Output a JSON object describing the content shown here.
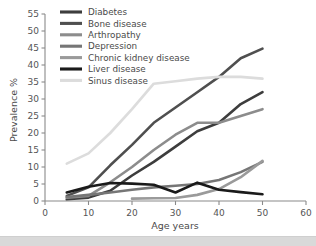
{
  "chart_data": {
    "type": "line",
    "title": "",
    "xlabel": "Age years",
    "ylabel": "Prevalence %",
    "xlim": [
      0,
      60
    ],
    "ylim": [
      0,
      55
    ],
    "xticks": [
      0,
      10,
      20,
      30,
      40,
      50,
      60
    ],
    "yticks": [
      0,
      5,
      10,
      15,
      20,
      25,
      30,
      35,
      40,
      45,
      50,
      55
    ],
    "grid": false,
    "legend_position": "top-left",
    "series": [
      {
        "name": "Diabetes",
        "color": "#3d3d3d",
        "width": 2.6,
        "x": [
          5,
          10,
          15,
          20,
          25,
          30,
          35,
          40,
          45,
          50
        ],
        "y": [
          0.5,
          1.0,
          3.0,
          7.5,
          11.5,
          16.0,
          20.5,
          23.0,
          28.5,
          32.0
        ]
      },
      {
        "name": "Bone disease",
        "color": "#4f4f4f",
        "width": 2.6,
        "x": [
          5,
          10,
          15,
          20,
          25,
          30,
          35,
          40,
          45,
          50
        ],
        "y": [
          1.5,
          4.0,
          10.5,
          16.5,
          23.0,
          27.5,
          32.0,
          36.5,
          42.0,
          44.8
        ]
      },
      {
        "name": "Arthropathy",
        "color": "#8c8c8c",
        "width": 2.6,
        "x": [
          5,
          10,
          15,
          20,
          25,
          30,
          35,
          40,
          45,
          50
        ],
        "y": [
          1.0,
          1.5,
          5.5,
          10.0,
          15.0,
          19.5,
          23.0,
          23.0,
          25.0,
          27.0
        ]
      },
      {
        "name": "Depression",
        "color": "#767676",
        "width": 2.6,
        "x": [
          5,
          10,
          15,
          20,
          25,
          30,
          35,
          40,
          45,
          50
        ],
        "y": [
          1.2,
          1.8,
          2.5,
          3.3,
          4.0,
          4.5,
          5.0,
          6.2,
          8.5,
          11.5
        ]
      },
      {
        "name": "Chronic kidney disease",
        "color": "#9a9a9a",
        "width": 2.6,
        "x": [
          20,
          25,
          30,
          35,
          40,
          45,
          50
        ],
        "y": [
          0.7,
          0.8,
          0.9,
          1.8,
          3.5,
          7.0,
          11.8
        ]
      },
      {
        "name": "Liver disease",
        "color": "#1a1a1a",
        "width": 2.6,
        "x": [
          5,
          10,
          15,
          20,
          25,
          30,
          35,
          40,
          45,
          50
        ],
        "y": [
          2.5,
          4.2,
          5.3,
          5.1,
          4.8,
          2.5,
          5.4,
          3.3,
          2.6,
          2.0
        ]
      },
      {
        "name": "Sinus disease",
        "color": "#dcdcdc",
        "width": 2.6,
        "x": [
          5,
          10,
          15,
          20,
          25,
          30,
          35,
          40,
          45,
          50
        ],
        "y": [
          11.0,
          14.0,
          20.0,
          27.0,
          34.5,
          35.2,
          36.0,
          36.5,
          36.5,
          36.0
        ]
      }
    ]
  },
  "axes": {
    "y_title": "Prevalence %",
    "x_title": "Age years",
    "y_tick_labels": [
      "0",
      "5",
      "10",
      "15",
      "20",
      "25",
      "30",
      "35",
      "40",
      "45",
      "50",
      "55"
    ],
    "x_tick_labels": [
      "0",
      "10",
      "20",
      "30",
      "40",
      "50",
      "60"
    ],
    "axis_color": "#8a8a8a"
  },
  "legend": {
    "items": [
      {
        "label": "Diabetes",
        "color": "#3d3d3d"
      },
      {
        "label": "Bone disease",
        "color": "#4f4f4f"
      },
      {
        "label": "Arthropathy",
        "color": "#8c8c8c"
      },
      {
        "label": "Depression",
        "color": "#767676"
      },
      {
        "label": "Chronic kidney disease",
        "color": "#9a9a9a"
      },
      {
        "label": "Liver disease",
        "color": "#1a1a1a"
      },
      {
        "label": "Sinus disease",
        "color": "#dcdcdc"
      }
    ]
  },
  "page": {
    "background": "#ffffff",
    "bottom_bar_color": "#d9d9d9"
  }
}
